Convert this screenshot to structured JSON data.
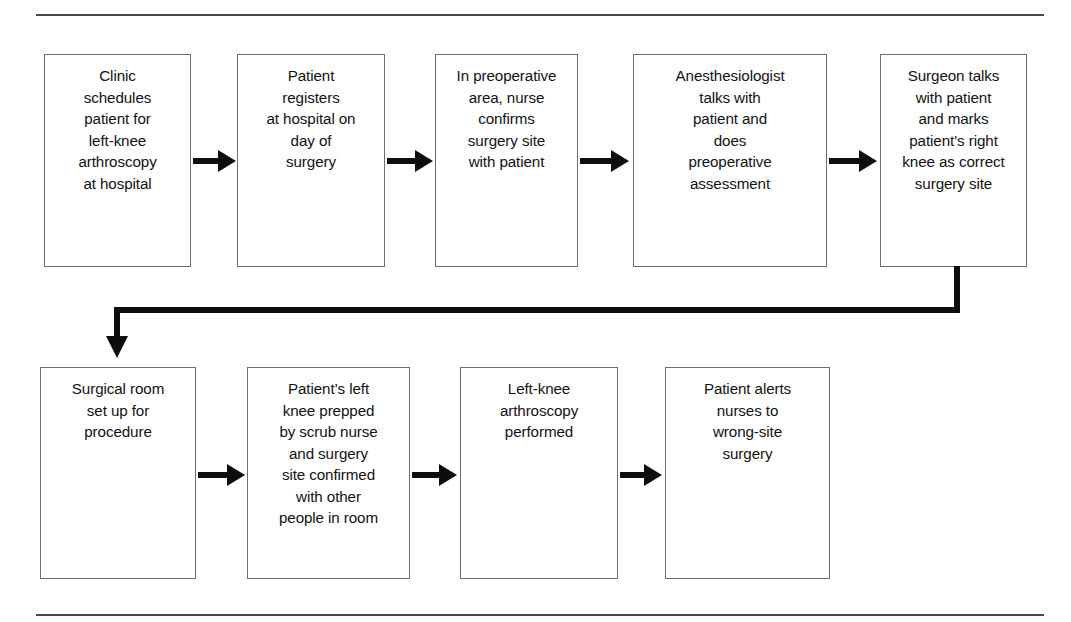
{
  "figure": {
    "type": "flowchart",
    "orientation": "left-to-right, wrapping to second row",
    "rules": {
      "top_rule": "horizontal-rule",
      "bottom_rule": "horizontal-rule"
    },
    "colors": {
      "box_border": "#6e6e70",
      "box_fill": "#ffffff",
      "arrow": "#0d0d0d",
      "rule": "#4a4a4a",
      "text": "#121212"
    }
  },
  "nodes": [
    {
      "id": "step-1",
      "text": "Clinic\nschedules\npatient for\nleft-knee\narthroscopy\nat hospital"
    },
    {
      "id": "step-2",
      "text": "Patient\nregisters\nat hospital on\nday of\nsurgery"
    },
    {
      "id": "step-3",
      "text": "In preoperative\narea, nurse\nconfirms\nsurgery site\nwith patient"
    },
    {
      "id": "step-4",
      "text": "Anesthesiologist\ntalks with\npatient and\ndoes\npreoperative\nassessment"
    },
    {
      "id": "step-5",
      "text": "Surgeon talks\nwith patient\nand marks\npatient’s right\nknee as correct\nsurgery site"
    },
    {
      "id": "step-6",
      "text": "Surgical room\nset up for\nprocedure"
    },
    {
      "id": "step-7",
      "text": "Patient’s left\nknee prepped\nby scrub nurse\nand surgery\nsite confirmed\nwith other\npeople in room"
    },
    {
      "id": "step-8",
      "text": "Left-knee\narthroscopy\nperformed"
    },
    {
      "id": "step-9",
      "text": "Patient alerts\nnurses to\nwrong-site\nsurgery"
    }
  ],
  "connectors": [
    {
      "id": "arrow-1-2",
      "from": "step-1",
      "to": "step-2",
      "kind": "arrow-right"
    },
    {
      "id": "arrow-2-3",
      "from": "step-2",
      "to": "step-3",
      "kind": "arrow-right"
    },
    {
      "id": "arrow-3-4",
      "from": "step-3",
      "to": "step-4",
      "kind": "arrow-right"
    },
    {
      "id": "arrow-4-5",
      "from": "step-4",
      "to": "step-5",
      "kind": "arrow-right"
    },
    {
      "id": "arrow-5-6",
      "from": "step-5",
      "to": "step-6",
      "kind": "elbow-down-left-down"
    },
    {
      "id": "arrow-6-7",
      "from": "step-6",
      "to": "step-7",
      "kind": "arrow-right"
    },
    {
      "id": "arrow-7-8",
      "from": "step-7",
      "to": "step-8",
      "kind": "arrow-right"
    },
    {
      "id": "arrow-8-9",
      "from": "step-8",
      "to": "step-9",
      "kind": "arrow-right"
    }
  ]
}
